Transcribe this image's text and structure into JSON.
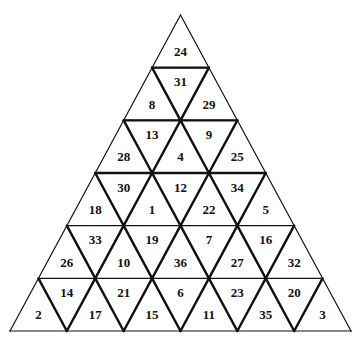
{
  "puzzle": {
    "type": "triangular-number-grid",
    "rows": 6,
    "geometry": {
      "apex": [
        180.5,
        15
      ],
      "base_left": [
        10,
        331
      ],
      "base_right": [
        351,
        331
      ]
    },
    "line_color": "#111111",
    "background": "#ffffff",
    "rows_values": [
      [
        "24"
      ],
      [
        "8",
        "31",
        "29"
      ],
      [
        "28",
        "13",
        "4",
        "9",
        "25"
      ],
      [
        "18",
        "30",
        "1",
        "12",
        "22",
        "34",
        "5"
      ],
      [
        "26",
        "33",
        "10",
        "19",
        "36",
        "7",
        "27",
        "16",
        "32"
      ],
      [
        "2",
        "14",
        "17",
        "21",
        "15",
        "6",
        "11",
        "23",
        "35",
        "20",
        "3"
      ]
    ]
  }
}
